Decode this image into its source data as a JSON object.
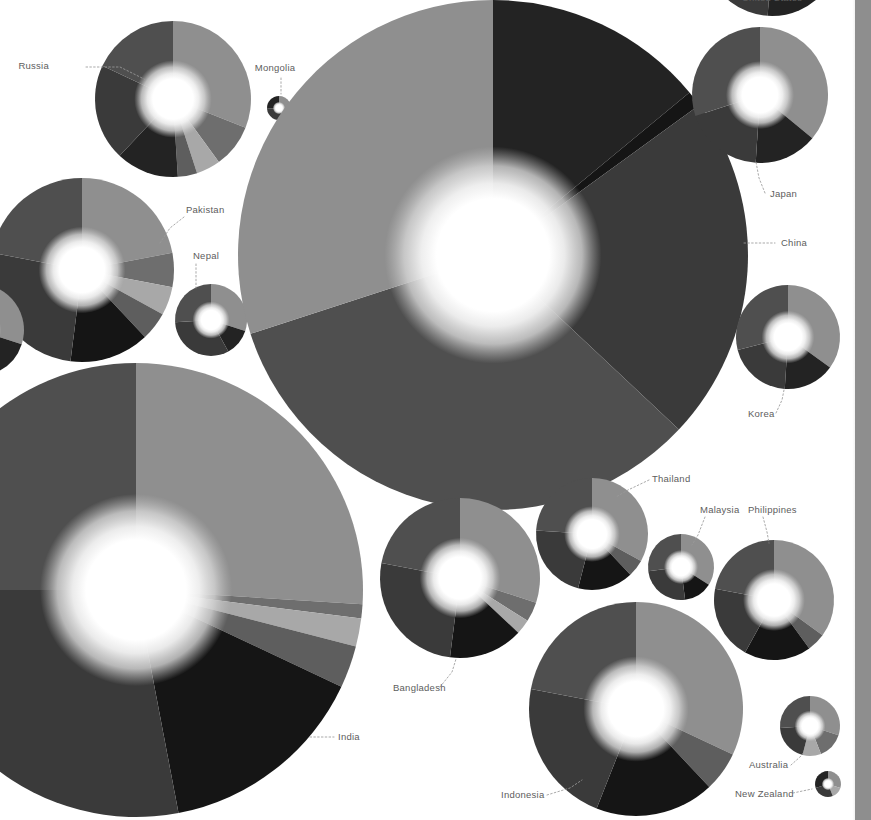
{
  "view": {
    "background": "#ffffff",
    "width": 871,
    "height": 820,
    "label_color": "#5d5d5d",
    "leader_color": "#9a9a9a"
  },
  "scrollbar": {
    "name": "vertical-scrollbar",
    "thumb_color": "#8e8e8e",
    "track_color": "#ffffff"
  },
  "palette": {
    "s1": "#8f8f8f",
    "s2": "#4f4f4f",
    "s3": "#3a3a3a",
    "s4": "#232323",
    "s5": "#6e6e6e",
    "s6": "#a8a8a8",
    "s7": "#5e5e5e",
    "s8": "#151515",
    "hub_outer": "#c9c9c9",
    "hub_mid": "#ededed",
    "hub_inner": "#ffffff"
  },
  "chart_data": {
    "type": "pie",
    "title": "",
    "subtitle": "",
    "xlabel": "",
    "ylabel": "",
    "legend_position": "none",
    "grid": false,
    "note": "Grid of donut/pie charts sized by total value; each country pie is split into shares rendered in a grayscale ramp. Slice values are percentages of each country total.",
    "series_names": [
      "Share A",
      "Share B",
      "Share C",
      "Share D",
      "Share E",
      "Share F",
      "Share G"
    ],
    "charts": [
      {
        "label": "Russia",
        "cx": 173,
        "cy": 99,
        "r": 78,
        "hub_r": 25,
        "label_x": 49,
        "label_y": 69,
        "anchor": "end",
        "leader": "M 86 67 L 120 67 L 146 80",
        "start_angle": -90,
        "values": [
          31,
          9,
          5,
          4,
          13,
          20,
          18
        ],
        "slice_colors": [
          "#8f8f8f",
          "#6e6e6e",
          "#a8a8a8",
          "#5e5e5e",
          "#232323",
          "#3a3a3a",
          "#4f4f4f"
        ]
      },
      {
        "label": "Mongolia",
        "cx": 279,
        "cy": 108,
        "r": 12,
        "hub_r": 4,
        "label_x": 275,
        "label_y": 71,
        "anchor": "middle",
        "leader": "M 281 78 L 281 94",
        "start_angle": -90,
        "values": [
          32,
          12,
          30,
          26
        ],
        "slice_colors": [
          "#8f8f8f",
          "#a8a8a8",
          "#3a3a3a",
          "#232323"
        ]
      },
      {
        "label": "Pakistan",
        "cx": 82,
        "cy": 270,
        "r": 92,
        "hub_r": 28,
        "label_x": 186,
        "label_y": 213,
        "anchor": "start",
        "leader": "M 184 217 L 170 228 L 160 243",
        "start_angle": -90,
        "values": [
          22,
          6,
          5,
          5,
          14,
          26,
          22
        ],
        "slice_colors": [
          "#8f8f8f",
          "#6e6e6e",
          "#a8a8a8",
          "#5e5e5e",
          "#151515",
          "#3a3a3a",
          "#4f4f4f"
        ]
      },
      {
        "label": "Nepal",
        "cx": 211,
        "cy": 320,
        "r": 36,
        "hub_r": 12,
        "label_x": 193,
        "label_y": 259,
        "anchor": "start",
        "leader": "M 196 264 L 196 288",
        "start_angle": -90,
        "values": [
          30,
          12,
          32,
          26
        ],
        "slice_colors": [
          "#8f8f8f",
          "#232323",
          "#3a3a3a",
          "#4f4f4f"
        ]
      },
      {
        "label": "China",
        "cx": 493,
        "cy": 255,
        "r": 255,
        "hub_r": 70,
        "label_x": 781,
        "label_y": 246,
        "anchor": "start",
        "leader": "M 744 243 L 775 243",
        "start_angle": -90,
        "values": [
          14,
          1,
          22,
          33,
          30
        ],
        "slice_colors": [
          "#232323",
          "#151515",
          "#3a3a3a",
          "#4f4f4f",
          "#8f8f8f"
        ]
      },
      {
        "label": "Japan",
        "cx": 760,
        "cy": 95,
        "r": 68,
        "hub_r": 22,
        "label_x": 770,
        "label_y": 197,
        "anchor": "start",
        "leader": "M 765 193 L 759 178 L 756 162",
        "start_angle": -90,
        "values": [
          36,
          15,
          19,
          30
        ],
        "slice_colors": [
          "#8f8f8f",
          "#232323",
          "#3a3a3a",
          "#4f4f4f"
        ]
      },
      {
        "label": "Korea",
        "cx": 788,
        "cy": 337,
        "r": 52,
        "hub_r": 17,
        "label_x": 748,
        "label_y": 417,
        "anchor": "start",
        "leader": "M 776 413 L 782 400 L 784 390",
        "start_angle": -90,
        "values": [
          35,
          16,
          20,
          29
        ],
        "slice_colors": [
          "#8f8f8f",
          "#232323",
          "#3a3a3a",
          "#4f4f4f"
        ]
      },
      {
        "label": "India",
        "cx": 136,
        "cy": 590,
        "r": 227,
        "hub_r": 62,
        "label_x": 338,
        "label_y": 740,
        "anchor": "start",
        "leader": "M 310 737 L 334 737",
        "start_angle": -90,
        "values": [
          26,
          1,
          2,
          3,
          15,
          28,
          25
        ],
        "slice_colors": [
          "#8f8f8f",
          "#6e6e6e",
          "#a8a8a8",
          "#5e5e5e",
          "#151515",
          "#3a3a3a",
          "#4f4f4f"
        ]
      },
      {
        "label": "Bangladesh",
        "cx": 460,
        "cy": 578,
        "r": 80,
        "hub_r": 26,
        "label_x": 393,
        "label_y": 691,
        "anchor": "start",
        "leader": "M 440 687 L 452 672 L 456 659",
        "start_angle": -90,
        "values": [
          30,
          4,
          3,
          15,
          26,
          22
        ],
        "slice_colors": [
          "#8f8f8f",
          "#6e6e6e",
          "#a8a8a8",
          "#151515",
          "#3a3a3a",
          "#4f4f4f"
        ]
      },
      {
        "label": "Thailand",
        "cx": 592,
        "cy": 534,
        "r": 56,
        "hub_r": 18,
        "label_x": 652,
        "label_y": 482,
        "anchor": "start",
        "leader": "M 649 480 L 628 490 L 616 497",
        "start_angle": -90,
        "values": [
          33,
          5,
          16,
          22,
          24
        ],
        "slice_colors": [
          "#8f8f8f",
          "#5e5e5e",
          "#151515",
          "#3a3a3a",
          "#4f4f4f"
        ]
      },
      {
        "label": "Malaysia",
        "cx": 681,
        "cy": 567,
        "r": 33,
        "hub_r": 11,
        "label_x": 700,
        "label_y": 513,
        "anchor": "start",
        "leader": "M 705 517 L 698 535 L 692 545",
        "start_angle": -90,
        "values": [
          34,
          14,
          25,
          27
        ],
        "slice_colors": [
          "#8f8f8f",
          "#151515",
          "#3a3a3a",
          "#4f4f4f"
        ]
      },
      {
        "label": "Philippines",
        "cx": 774,
        "cy": 600,
        "r": 60,
        "hub_r": 20,
        "label_x": 748,
        "label_y": 513,
        "anchor": "start",
        "leader": "M 763 517 L 767 532 L 769 543",
        "start_angle": -90,
        "values": [
          35,
          5,
          18,
          20,
          22
        ],
        "slice_colors": [
          "#8f8f8f",
          "#5e5e5e",
          "#151515",
          "#3a3a3a",
          "#4f4f4f"
        ]
      },
      {
        "label": "Indonesia",
        "cx": 636,
        "cy": 709,
        "r": 107,
        "hub_r": 34,
        "label_x": 501,
        "label_y": 798,
        "anchor": "start",
        "leader": "M 547 795 L 570 788 L 582 780",
        "start_angle": -90,
        "values": [
          32,
          6,
          18,
          22,
          22
        ],
        "slice_colors": [
          "#8f8f8f",
          "#5e5e5e",
          "#151515",
          "#3a3a3a",
          "#4f4f4f"
        ]
      },
      {
        "label": "Australia",
        "cx": 810,
        "cy": 726,
        "r": 30,
        "hub_r": 10,
        "label_x": 749,
        "label_y": 768,
        "anchor": "start",
        "leader": "M 791 765 L 800 757 L 804 752",
        "start_angle": -90,
        "values": [
          30,
          14,
          10,
          20,
          26
        ],
        "slice_colors": [
          "#8f8f8f",
          "#6e6e6e",
          "#a8a8a8",
          "#3a3a3a",
          "#4f4f4f"
        ]
      },
      {
        "label": "New Zealand",
        "cx": 828,
        "cy": 784,
        "r": 13,
        "hub_r": 4,
        "label_x": 735,
        "label_y": 797,
        "anchor": "start",
        "leader": "M 793 793 L 812 789",
        "start_angle": -90,
        "values": [
          30,
          14,
          26,
          30
        ],
        "slice_colors": [
          "#8f8f8f",
          "#a8a8a8",
          "#3a3a3a",
          "#232323"
        ]
      },
      {
        "label": "United States",
        "cx": 772,
        "cy": -52,
        "r": 68,
        "hub_r": 22,
        "label_x": 742,
        "label_y": 1,
        "anchor": "start",
        "leader": "",
        "start_angle": -90,
        "values": [
          36,
          15,
          19,
          30
        ],
        "slice_colors": [
          "#8f8f8f",
          "#232323",
          "#3a3a3a",
          "#4f4f4f"
        ]
      },
      {
        "label": "",
        "cx": -22,
        "cy": 330,
        "r": 46,
        "hub_r": 15,
        "label_x": -999,
        "label_y": -999,
        "anchor": "start",
        "leader": "",
        "start_angle": -90,
        "values": [
          30,
          14,
          26,
          30
        ],
        "slice_colors": [
          "#8f8f8f",
          "#232323",
          "#3a3a3a",
          "#4f4f4f"
        ]
      }
    ]
  }
}
